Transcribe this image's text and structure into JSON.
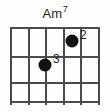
{
  "chord": {
    "name": "Am7",
    "root_label": "Am",
    "extension_label": "7",
    "instrument": "guitar",
    "string_count": 6,
    "fret_count": 3,
    "starting_fret": 1,
    "nut_shown": true,
    "colors": {
      "background": "#fefefe",
      "grid": "#4b4b4b",
      "dot": "#111111",
      "text": "#1c1c1c"
    },
    "fingerings": [
      {
        "finger_label": "2",
        "string": 5,
        "fret": 1,
        "x_pct": 68.9,
        "y_pct": 12.2,
        "label_dx": 8,
        "label_dy": -12
      },
      {
        "finger_label": "3",
        "string": 3,
        "fret": 2,
        "x_pct": 38.9,
        "y_pct": 51.4,
        "label_dx": 8,
        "label_dy": -12
      }
    ],
    "strings_x_pct": [
      0,
      20,
      39.5,
      59,
      69,
      98
    ],
    "frets_y_pct": [
      0,
      39,
      74,
      100
    ]
  }
}
